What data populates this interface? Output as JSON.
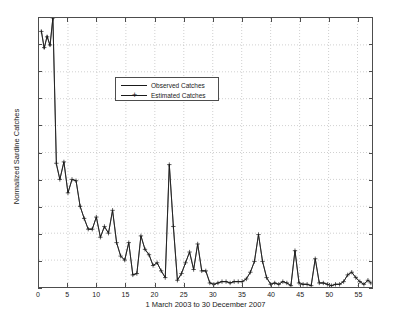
{
  "chart_data": {
    "type": "line",
    "title": "",
    "xlabel": "1 March 2003 to 30 December 2007",
    "ylabel": "Normalized Sardine Catches",
    "xlim": [
      0,
      57.5
    ],
    "ylim": [
      0,
      1
    ],
    "grid": true,
    "legend_position": "upper-center-left",
    "xticks": [
      0,
      5,
      10,
      15,
      20,
      25,
      30,
      35,
      40,
      45,
      50,
      55
    ],
    "xtick_labels": [
      "0",
      "5",
      "10",
      "15",
      "20",
      "25",
      "30",
      "35",
      "40",
      "45",
      "50",
      "55"
    ],
    "yticks": [
      0,
      0.1,
      0.2,
      0.3,
      0.4,
      0.5,
      0.6,
      0.7,
      0.8,
      0.9,
      1
    ],
    "ytick_labels": [
      "0",
      "0.1",
      "0.2",
      "0.3",
      "0.4",
      "0.5",
      "0.6",
      "0.7",
      "0.8",
      "0.9",
      "1"
    ],
    "series": [
      {
        "name": "Observed Catches",
        "color": "#1a1a1a",
        "marker": "none",
        "x": [
          0.4,
          0.9,
          1.4,
          1.9,
          2.4,
          3.0,
          3.6,
          4.3,
          5.0,
          5.7,
          6.4,
          7.1,
          7.8,
          8.5,
          9.2,
          9.9,
          10.6,
          11.3,
          12.0,
          12.7,
          13.4,
          14.1,
          14.8,
          15.5,
          16.2,
          16.9,
          17.6,
          18.3,
          19.0,
          19.7,
          20.4,
          21.1,
          21.8,
          22.5,
          23.2,
          23.9,
          24.6,
          25.3,
          26.0,
          26.7,
          27.4,
          28.1,
          28.8,
          29.5,
          30.2,
          30.9,
          31.6,
          32.3,
          33.0,
          33.7,
          34.4,
          35.1,
          35.8,
          36.5,
          37.2,
          37.9,
          38.6,
          39.3,
          40.0,
          40.7,
          41.4,
          42.1,
          42.8,
          43.5,
          44.2,
          44.9,
          45.6,
          46.3,
          47.0,
          47.7,
          48.4,
          49.1,
          49.8,
          50.5,
          51.2,
          51.9,
          52.6,
          53.3,
          54.0,
          54.7,
          55.4,
          56.1,
          56.8,
          57.3
        ],
        "y": [
          0.955,
          0.885,
          0.935,
          0.895,
          1.0,
          0.455,
          0.4,
          0.465,
          0.35,
          0.4,
          0.395,
          0.3,
          0.255,
          0.215,
          0.215,
          0.26,
          0.185,
          0.225,
          0.2,
          0.285,
          0.165,
          0.115,
          0.1,
          0.165,
          0.045,
          0.05,
          0.19,
          0.14,
          0.12,
          0.08,
          0.09,
          0.06,
          0.035,
          0.455,
          0.225,
          0.025,
          0.05,
          0.09,
          0.13,
          0.065,
          0.16,
          0.06,
          0.06,
          0.015,
          0.01,
          0.015,
          0.02,
          0.02,
          0.015,
          0.02,
          0.02,
          0.02,
          0.03,
          0.055,
          0.095,
          0.195,
          0.095,
          0.035,
          0.01,
          0.015,
          0.01,
          0.02,
          0.015,
          0.005,
          0.135,
          0.015,
          0.01,
          0.01,
          0.005,
          0.105,
          0.015,
          0.015,
          0.01,
          0.005,
          0.01,
          0.01,
          0.02,
          0.045,
          0.055,
          0.035,
          0.02,
          0.01,
          0.025,
          0.015
        ]
      },
      {
        "name": "Estimated Catches",
        "color": "#1a1a1a",
        "marker": "plus",
        "x": [
          0.4,
          0.9,
          1.4,
          1.9,
          2.4,
          3.0,
          3.6,
          4.3,
          5.0,
          5.7,
          6.4,
          7.1,
          7.8,
          8.5,
          9.2,
          9.9,
          10.6,
          11.3,
          12.0,
          12.7,
          13.4,
          14.1,
          14.8,
          15.5,
          16.2,
          16.9,
          17.6,
          18.3,
          19.0,
          19.7,
          20.4,
          21.1,
          21.8,
          22.5,
          23.2,
          23.9,
          24.6,
          25.3,
          26.0,
          26.7,
          27.4,
          28.1,
          28.8,
          29.5,
          30.2,
          30.9,
          31.6,
          32.3,
          33.0,
          33.7,
          34.4,
          35.1,
          35.8,
          36.5,
          37.2,
          37.9,
          38.6,
          39.3,
          40.0,
          40.7,
          41.4,
          42.1,
          42.8,
          43.5,
          44.2,
          44.9,
          45.6,
          46.3,
          47.0,
          47.7,
          48.4,
          49.1,
          49.8,
          50.5,
          51.2,
          51.9,
          52.6,
          53.3,
          54.0,
          54.7,
          55.4,
          56.1,
          56.8,
          57.3
        ],
        "y": [
          0.95,
          0.89,
          0.93,
          0.9,
          1.0,
          0.46,
          0.4,
          0.465,
          0.35,
          0.4,
          0.395,
          0.3,
          0.255,
          0.215,
          0.215,
          0.26,
          0.185,
          0.225,
          0.2,
          0.285,
          0.165,
          0.115,
          0.1,
          0.165,
          0.045,
          0.05,
          0.19,
          0.14,
          0.12,
          0.08,
          0.09,
          0.06,
          0.035,
          0.455,
          0.225,
          0.025,
          0.05,
          0.09,
          0.13,
          0.065,
          0.16,
          0.06,
          0.06,
          0.015,
          0.01,
          0.015,
          0.02,
          0.02,
          0.015,
          0.02,
          0.02,
          0.02,
          0.03,
          0.055,
          0.095,
          0.195,
          0.095,
          0.035,
          0.01,
          0.015,
          0.01,
          0.02,
          0.015,
          0.005,
          0.135,
          0.015,
          0.01,
          0.01,
          0.005,
          0.105,
          0.015,
          0.015,
          0.01,
          0.005,
          0.01,
          0.01,
          0.02,
          0.045,
          0.055,
          0.035,
          0.02,
          0.01,
          0.025,
          0.015
        ]
      }
    ]
  },
  "legend": {
    "items": [
      {
        "label": "Observed Catches",
        "marker": "none"
      },
      {
        "label": "Estimated Catches",
        "marker": "plus"
      }
    ]
  }
}
